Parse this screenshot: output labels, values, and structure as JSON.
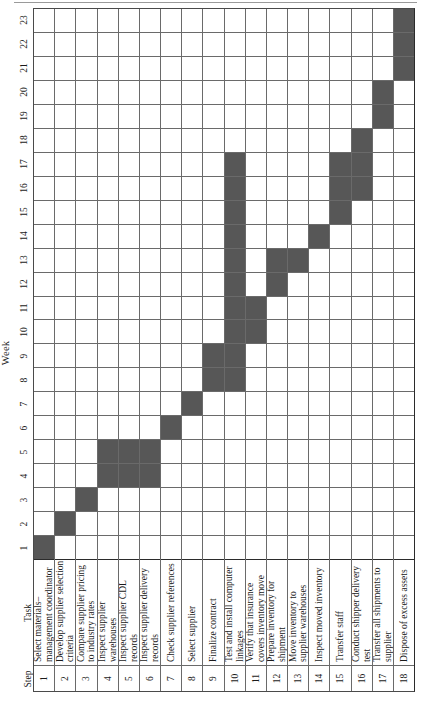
{
  "chart_data": {
    "type": "bar",
    "chart_kind": "gantt",
    "title": "",
    "xlabel": "Week",
    "ylabel": "Task",
    "orientation": "rotated-90-ccw",
    "grid": true,
    "legend": null,
    "bar_color": "#575757",
    "grid_color": "#6a6a6a",
    "week_axis_label": "Week",
    "week_min": 1,
    "week_max": 23,
    "weeks": [
      1,
      2,
      3,
      4,
      5,
      6,
      7,
      8,
      9,
      10,
      11,
      12,
      13,
      14,
      15,
      16,
      17,
      18,
      19,
      20,
      21,
      22,
      23
    ],
    "columns": [
      "Step",
      "Task"
    ],
    "step_header": "Step",
    "task_header": "Task",
    "rows": [
      {
        "step": "1",
        "task": "Select materials–management coordinator",
        "start": 1,
        "end": 1
      },
      {
        "step": "2",
        "task": "Develop supplier selection criteria",
        "start": 2,
        "end": 2
      },
      {
        "step": "3",
        "task": "Compare supplier pricing to industry rates",
        "start": 3,
        "end": 3
      },
      {
        "step": "4",
        "task": "Inspect supplier warehouses",
        "start": 4,
        "end": 5
      },
      {
        "step": "5",
        "task": "Inspect supplier CDL records",
        "start": 4,
        "end": 5
      },
      {
        "step": "6",
        "task": "Inspect supplier delivery records",
        "start": 4,
        "end": 5
      },
      {
        "step": "7",
        "task": "Check supplier references",
        "start": 6,
        "end": 6
      },
      {
        "step": "8",
        "task": "Select supplier",
        "start": 7,
        "end": 7
      },
      {
        "step": "9",
        "task": "Finalize contract",
        "start": 8,
        "end": 9
      },
      {
        "step": "10",
        "task": "Test and install computer linkages",
        "start": 8,
        "end": 17
      },
      {
        "step": "11",
        "task": "Verify that insurance covers inventory move",
        "start": 10,
        "end": 11
      },
      {
        "step": "12",
        "task": "Prepare inventory for shipment",
        "start": 12,
        "end": 13
      },
      {
        "step": "13",
        "task": "Move inventory to supplier warehouses",
        "start": 13,
        "end": 13
      },
      {
        "step": "14",
        "task": "Inspect moved inventory",
        "start": 14,
        "end": 14
      },
      {
        "step": "15",
        "task": "Transfer staff",
        "start": 15,
        "end": 17
      },
      {
        "step": "16",
        "task": "Conduct shipper delivery test",
        "start": 16,
        "end": 18
      },
      {
        "step": "17",
        "task": "Transfer all shipments to supplier",
        "start": 19,
        "end": 20
      },
      {
        "step": "18",
        "task": "Dispose of excess assets",
        "start": 21,
        "end": 23
      }
    ]
  }
}
